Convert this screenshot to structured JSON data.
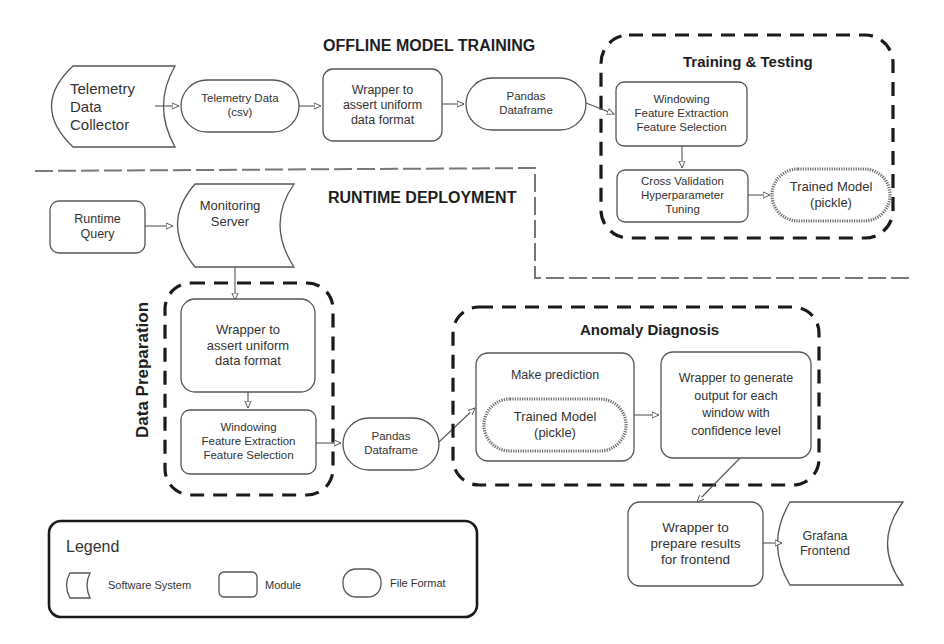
{
  "sections": {
    "offline": "OFFLINE MODEL TRAINING",
    "runtime": "RUNTIME DEPLOYMENT"
  },
  "groups": {
    "training_testing": "Training & Testing",
    "data_preparation": "Data Preparation",
    "anomaly_diagnosis": "Anomaly Diagnosis"
  },
  "offline_nodes": {
    "telemetry_collector": "Telemetry\nData\nCollector",
    "telemetry_csv": "Telemetry Data\n(csv)",
    "wrapper_uniform": "Wrapper to\nassert uniform\ndata format",
    "pandas_df": "Pandas\nDataframe",
    "windowing": "Windowing\nFeature Extraction\nFeature Selection",
    "cross_validation": "Cross Validation\nHyperparameter\nTuning",
    "trained_model": "Trained Model\n(pickle)"
  },
  "runtime_nodes": {
    "runtime_query": "Runtime\nQuery",
    "monitoring_server": "Monitoring\nServer",
    "wrapper_uniform": "Wrapper to\nassert uniform\ndata format",
    "windowing": "Windowing\nFeature Extraction\nFeature Selection",
    "pandas_df": "Pandas\nDataframe",
    "make_prediction": "Make prediction",
    "trained_model": "Trained Model\n(pickle)",
    "wrapper_generate": "Wrapper to generate\noutput for each\nwindow with\nconfidence level",
    "wrapper_prepare": "Wrapper to\nprepare results\nfor frontend",
    "grafana": "Grafana\nFrontend"
  },
  "legend": {
    "title": "Legend",
    "items": [
      {
        "shape": "software-system",
        "label": "Software System"
      },
      {
        "shape": "module",
        "label": "Module"
      },
      {
        "shape": "file-format",
        "label": "File Format"
      }
    ]
  },
  "edges": [
    [
      "Telemetry Data Collector",
      "Telemetry Data (csv)"
    ],
    [
      "Telemetry Data (csv)",
      "Wrapper to assert uniform data format"
    ],
    [
      "Wrapper to assert uniform data format",
      "Pandas Dataframe"
    ],
    [
      "Pandas Dataframe",
      "Windowing / Feature Extraction / Feature Selection"
    ],
    [
      "Windowing / Feature Extraction / Feature Selection",
      "Cross Validation / Hyperparameter Tuning"
    ],
    [
      "Cross Validation / Hyperparameter Tuning",
      "Trained Model (pickle)"
    ],
    [
      "Runtime Query",
      "Monitoring Server"
    ],
    [
      "Monitoring Server",
      "Wrapper to assert uniform data format"
    ],
    [
      "Wrapper to assert uniform data format",
      "Windowing / Feature Extraction / Feature Selection"
    ],
    [
      "Windowing / Feature Extraction / Feature Selection",
      "Pandas Dataframe"
    ],
    [
      "Pandas Dataframe",
      "Make prediction"
    ],
    [
      "Make prediction",
      "Wrapper to generate output for each window with confidence level"
    ],
    [
      "Wrapper to generate output for each window with confidence level",
      "Wrapper to prepare results for frontend"
    ],
    [
      "Wrapper to prepare results for frontend",
      "Grafana Frontend"
    ]
  ]
}
